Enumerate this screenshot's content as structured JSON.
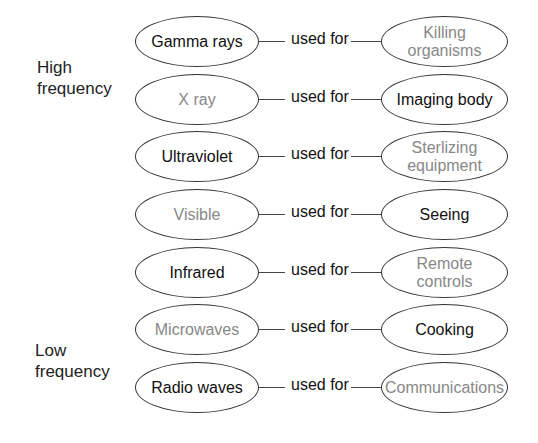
{
  "labels": {
    "high": [
      "High",
      "frequency"
    ],
    "low": [
      "Low",
      "frequency"
    ]
  },
  "connector_label": "used for",
  "colors": {
    "dark_text": "#111111",
    "light_text": "#888888",
    "outline": "#333333"
  },
  "rows": [
    {
      "wave": "Gamma rays",
      "wave_tone": "black",
      "use": "Killing organisms",
      "use_tone": "gray"
    },
    {
      "wave": "X ray",
      "wave_tone": "gray",
      "use": "Imaging body",
      "use_tone": "black"
    },
    {
      "wave": "Ultraviolet",
      "wave_tone": "black",
      "use": "Sterlizing equipment",
      "use_tone": "gray"
    },
    {
      "wave": "Visible",
      "wave_tone": "gray",
      "use": "Seeing",
      "use_tone": "black"
    },
    {
      "wave": "Infrared",
      "wave_tone": "black",
      "use": "Remote controls",
      "use_tone": "gray"
    },
    {
      "wave": "Microwaves",
      "wave_tone": "gray",
      "use": "Cooking",
      "use_tone": "black"
    },
    {
      "wave": "Radio waves",
      "wave_tone": "black",
      "use": "Communications",
      "use_tone": "gray"
    }
  ]
}
